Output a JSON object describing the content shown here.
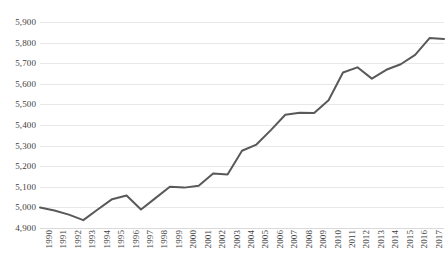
{
  "chart_data": {
    "type": "line",
    "title": "",
    "subtitle": "",
    "xlabel": "",
    "ylabel": "",
    "grid": true,
    "legend": false,
    "legend_position": "none",
    "line_color": "#595959",
    "gridline_color": "#e8e8e8",
    "background_color": "#ffffff",
    "ylim": [
      4900,
      5900
    ],
    "ytick_step": 100,
    "ytick_labels": [
      "5,900",
      "5,800",
      "5,700",
      "5,600",
      "5,500",
      "5,400",
      "5,300",
      "5,200",
      "5,100",
      "5,000",
      "4,900"
    ],
    "ytick_values": [
      5900,
      5800,
      5700,
      5600,
      5500,
      5400,
      5300,
      5200,
      5100,
      5000,
      4900
    ],
    "categories": [
      "1990",
      "1991",
      "1992",
      "1993",
      "1994",
      "1995",
      "1996",
      "1997",
      "1998",
      "1999",
      "2000",
      "2001",
      "2002",
      "2003",
      "2004",
      "2005",
      "2006",
      "2007",
      "2008",
      "2009",
      "2010",
      "2011",
      "2012",
      "2013",
      "2014",
      "2015",
      "2016",
      "2017",
      "2018"
    ],
    "values": [
      5000,
      4985,
      4965,
      4938,
      4990,
      5040,
      5058,
      4990,
      5045,
      5100,
      5096,
      5105,
      5165,
      5160,
      5275,
      5305,
      5375,
      5450,
      5460,
      5458,
      5520,
      5655,
      5680,
      5625,
      5668,
      5695,
      5740,
      5822,
      5818
    ],
    "series": [
      {
        "name": "series-1",
        "color": "#595959",
        "values": [
          5000,
          4985,
          4965,
          4938,
          4990,
          5040,
          5058,
          4990,
          5045,
          5100,
          5096,
          5105,
          5165,
          5160,
          5275,
          5305,
          5375,
          5450,
          5460,
          5458,
          5520,
          5655,
          5680,
          5625,
          5668,
          5695,
          5740,
          5822,
          5818
        ]
      }
    ]
  }
}
